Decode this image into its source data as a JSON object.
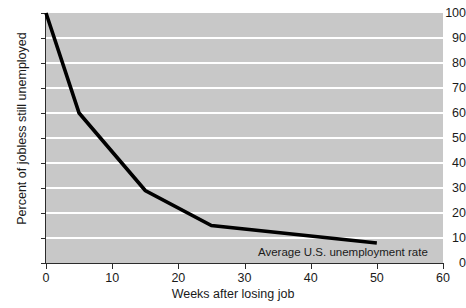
{
  "chart_data": {
    "type": "line",
    "title": "",
    "xlabel": "Weeks after losing job",
    "ylabel": "Percent of jobless still unemployed",
    "xlim": [
      0,
      60
    ],
    "ylim": [
      0,
      100
    ],
    "xticks": [
      0,
      10,
      20,
      30,
      40,
      50,
      60
    ],
    "yticks": [
      0,
      10,
      20,
      30,
      40,
      50,
      60,
      70,
      80,
      90,
      100
    ],
    "grid": "horizontal",
    "legend": "none",
    "plot_background": "#c8c8c8",
    "gridline_color": "#ffffff",
    "series_color": "#000000",
    "series": [
      {
        "name": "Percent of jobless still unemployed",
        "x": [
          0,
          5,
          15,
          25,
          50
        ],
        "values": [
          100,
          60,
          29,
          15,
          8
        ]
      }
    ],
    "annotations": [
      {
        "text": "Average U.S. unemployment rate",
        "x": 37,
        "y": 5
      }
    ]
  },
  "axes": {
    "y_title": "Percent of jobless still unemployed",
    "x_title": "Weeks after losing job",
    "y_tick_labels": [
      "100",
      "90",
      "80",
      "70",
      "60",
      "50",
      "40",
      "30",
      "20",
      "10",
      "0"
    ],
    "x_tick_labels": [
      "0",
      "10",
      "20",
      "30",
      "40",
      "50",
      "60"
    ]
  },
  "annotation": {
    "label": "Average U.S. unemployment rate"
  }
}
